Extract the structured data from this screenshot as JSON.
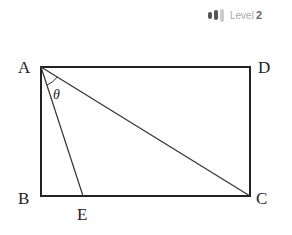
{
  "level": {
    "label": "Level",
    "number": "2",
    "bars": [
      {
        "height": 7,
        "color": "#555555"
      },
      {
        "height": 10,
        "color": "#555555"
      },
      {
        "height": 13,
        "color": "#cccccc"
      }
    ]
  },
  "diagram": {
    "points": {
      "A": {
        "label": "A",
        "x": 41,
        "y": 67
      },
      "D": {
        "label": "D",
        "x": 250,
        "y": 67
      },
      "B": {
        "label": "B",
        "x": 41,
        "y": 196
      },
      "C": {
        "label": "C",
        "x": 250,
        "y": 196
      },
      "E": {
        "label": "E",
        "x": 83,
        "y": 196
      }
    },
    "angle_label": "θ"
  }
}
